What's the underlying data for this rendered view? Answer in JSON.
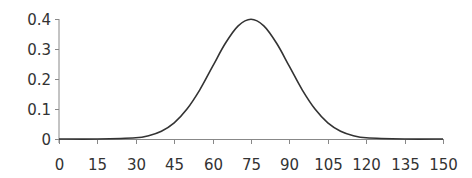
{
  "chart_data": {
    "type": "line",
    "title": "",
    "xlabel": "",
    "ylabel": "",
    "xlim": [
      0,
      150
    ],
    "ylim": [
      0,
      0.4
    ],
    "grid": false,
    "legend": null,
    "x_ticks": [
      "0",
      "15",
      "30",
      "45",
      "60",
      "75",
      "90",
      "105",
      "120",
      "135",
      "150"
    ],
    "y_ticks": [
      "0",
      "0.1",
      "0.2",
      "0.3",
      "0.4"
    ],
    "series": [
      {
        "name": "normal-density",
        "description": "Bell curve centered at 75, standard deviation ~15, peak ~0.399",
        "x": [
          0,
          15,
          30,
          35,
          40,
          45,
          50,
          55,
          60,
          65,
          70,
          75,
          80,
          85,
          90,
          95,
          100,
          105,
          110,
          115,
          120,
          135,
          150
        ],
        "values": [
          0.0,
          0.0,
          0.004,
          0.011,
          0.026,
          0.054,
          0.1,
          0.164,
          0.242,
          0.319,
          0.377,
          0.399,
          0.377,
          0.319,
          0.242,
          0.164,
          0.1,
          0.054,
          0.026,
          0.011,
          0.004,
          0.0,
          0.0
        ]
      }
    ],
    "colors": {
      "line": "#333333",
      "axis": "#888888",
      "text": "#333333"
    }
  }
}
